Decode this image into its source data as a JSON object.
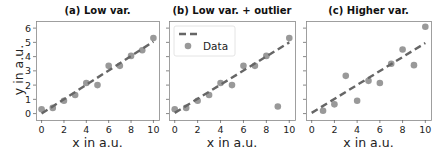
{
  "figure": {
    "ylabel": "y in a.u.",
    "xlabel": "x in a.u.",
    "legend": {
      "fit_label": "",
      "data_label": "Data"
    },
    "colors": {
      "points": "#999999",
      "fit_line": "#666666",
      "frame": "#888888",
      "text": "#222222"
    }
  },
  "chart_data": [
    {
      "type": "scatter",
      "title": "(a) Low var.",
      "xlabel": "x in a.u.",
      "ylabel": "y in a.u.",
      "xlim": [
        -0.5,
        10.5
      ],
      "ylim": [
        -0.45,
        6.5
      ],
      "xticks": [
        0,
        2,
        4,
        6,
        8,
        10
      ],
      "yticks": [
        0,
        1,
        2,
        3,
        4,
        5,
        6
      ],
      "grid": false,
      "series": [
        {
          "name": "Data",
          "type": "scatter",
          "x": [
            0,
            1,
            2,
            3,
            4,
            5,
            6,
            7,
            8,
            9,
            10
          ],
          "y": [
            0.3,
            0.4,
            0.9,
            1.3,
            2.15,
            2.0,
            3.35,
            3.35,
            4.05,
            4.45,
            5.3
          ]
        },
        {
          "name": "Fit",
          "type": "line",
          "style": "dashed",
          "x": [
            0,
            10
          ],
          "y": [
            0.0,
            5.05
          ]
        }
      ]
    },
    {
      "type": "scatter",
      "title": "(b) Low var. + outlier",
      "xlabel": "x in a.u.",
      "ylabel": "",
      "xlim": [
        -0.5,
        10.5
      ],
      "ylim": [
        -0.45,
        6.5
      ],
      "xticks": [
        0,
        2,
        4,
        6,
        8,
        10
      ],
      "yticks": [
        0,
        1,
        2,
        3,
        4,
        5,
        6
      ],
      "show_yticklabels": false,
      "grid": false,
      "legend": {
        "position": "upper left",
        "entries": [
          "Fit (dashed)",
          "Data"
        ]
      },
      "series": [
        {
          "name": "Data",
          "type": "scatter",
          "x": [
            0,
            1,
            2,
            3,
            4,
            5,
            6,
            7,
            8,
            9,
            10
          ],
          "y": [
            0.3,
            0.4,
            0.9,
            1.3,
            2.15,
            2.0,
            3.35,
            3.35,
            4.05,
            0.5,
            5.3
          ]
        },
        {
          "name": "Fit",
          "type": "line",
          "style": "dashed",
          "x": [
            0,
            10
          ],
          "y": [
            0.05,
            5.0
          ]
        }
      ]
    },
    {
      "type": "scatter",
      "title": "(c) Higher var.",
      "xlabel": "x in a.u.",
      "ylabel": "",
      "xlim": [
        -0.5,
        10.5
      ],
      "ylim": [
        -0.45,
        6.5
      ],
      "xticks": [
        0,
        2,
        4,
        6,
        8,
        10
      ],
      "yticks": [
        0,
        1,
        2,
        3,
        4,
        5,
        6
      ],
      "show_yticklabels": false,
      "grid": false,
      "series": [
        {
          "name": "Data",
          "type": "scatter",
          "x": [
            1,
            2,
            3,
            4,
            5,
            6,
            7,
            8,
            9,
            10
          ],
          "y": [
            0.2,
            0.65,
            2.65,
            0.9,
            2.3,
            2.15,
            3.5,
            4.5,
            3.4,
            6.1
          ]
        },
        {
          "name": "Fit",
          "type": "line",
          "style": "dashed",
          "x": [
            0,
            10
          ],
          "y": [
            0.05,
            4.95
          ]
        }
      ]
    }
  ]
}
